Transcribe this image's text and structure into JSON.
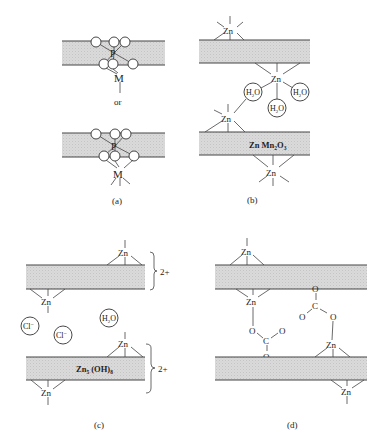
{
  "figure": {
    "panels": [
      {
        "id": "a",
        "caption": "(a)",
        "connector_text": "or",
        "metal_label": "M",
        "center_atom_label": "P",
        "layers": 2
      },
      {
        "id": "b",
        "caption": "(b)",
        "layer_label_main": "Zn Mn",
        "layer_label_sub1": "2",
        "layer_label_mid": "O",
        "layer_label_sub2": "3",
        "zn_label": "Zn",
        "water_label_main": "H",
        "water_label_sub": "2",
        "water_label_end": "O",
        "water_count": 3
      },
      {
        "id": "c",
        "caption": "(c)",
        "layer_label_main": "Zn",
        "layer_label_sub1": "5",
        "layer_label_mid": " (OH)",
        "layer_label_sub2": "8",
        "zn_label": "Zn",
        "charge_label": "2+",
        "anion_label": "Cl",
        "anion_charge": "−",
        "water_label_main": "H",
        "water_label_sub": "2",
        "water_label_end": "O"
      },
      {
        "id": "d",
        "caption": "(d)",
        "zn_label": "Zn",
        "oxygen_label": "O",
        "carbon_label": "C"
      }
    ],
    "colors": {
      "band_fill": "#d6d6d6",
      "line": "#444444",
      "background": "#ffffff"
    }
  }
}
